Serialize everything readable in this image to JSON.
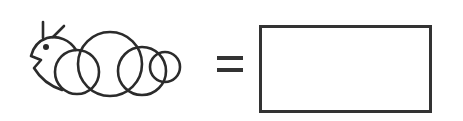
{
  "puzzle": {
    "figure": "caterpillar",
    "figure_parts": {
      "head": "head",
      "eye": "eye",
      "antennae": 2,
      "body_segments": 4
    },
    "operator": "=",
    "answer_box": {
      "value": ""
    }
  },
  "colors": {
    "stroke": "#2b2b2b",
    "box_border": "#333333",
    "background": "#ffffff"
  }
}
